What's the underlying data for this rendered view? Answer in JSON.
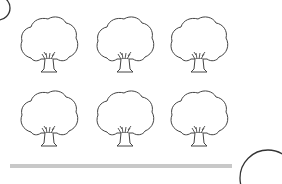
{
  "worksheet": {
    "trees": [
      {
        "row": 1,
        "col": 1,
        "x": 17,
        "y": 14
      },
      {
        "row": 1,
        "col": 2,
        "x": 93,
        "y": 14
      },
      {
        "row": 1,
        "col": 3,
        "x": 167,
        "y": 14
      },
      {
        "row": 2,
        "col": 1,
        "x": 17,
        "y": 88
      },
      {
        "row": 2,
        "col": 2,
        "x": 93,
        "y": 88
      },
      {
        "row": 2,
        "col": 3,
        "x": 167,
        "y": 88
      }
    ],
    "colors": {
      "line": "#333333",
      "bar": "#c8c8c8",
      "background": "#ffffff"
    }
  }
}
